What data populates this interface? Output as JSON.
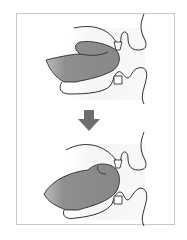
{
  "diagram": {
    "type": "anatomical-sequence",
    "description_visible": "Two side-view mouth illustrations connected by a downward arrow",
    "panels": [
      {
        "id": "before",
        "label": ""
      },
      {
        "id": "after",
        "label": ""
      }
    ],
    "arrow": {
      "direction": "down"
    },
    "colors": {
      "tongue": "#8c8c8c",
      "outline": "#1a1a1a",
      "shade": "#ececec",
      "arrow": "#6e6e6e",
      "frame": "#c8c8c8"
    }
  }
}
